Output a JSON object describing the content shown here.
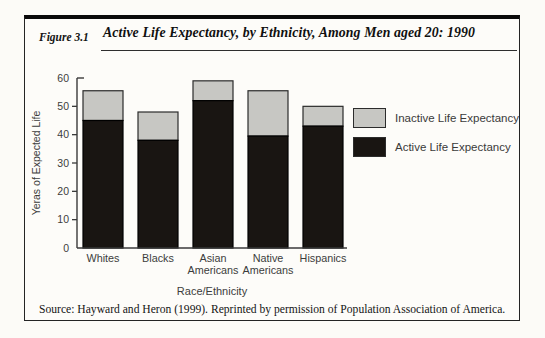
{
  "header": {
    "figure_label": "Figure 3.1",
    "title": "Active Life Expectancy, by Ethnicity, Among Men aged 20: 1990"
  },
  "source": "Source: Hayward and Heron (1999). Reprinted by permission of Population Association of America.",
  "legend": {
    "position": "right",
    "items": [
      {
        "label": "Inactive Life Expectancy",
        "color": "#c7c7c3"
      },
      {
        "label": "Active Life Expectancy",
        "color": "#191512"
      }
    ]
  },
  "chart_data": {
    "type": "bar",
    "stacked": true,
    "title": "Active Life Expectancy, by Ethnicity, Among Men aged 20: 1990",
    "categories": [
      "Whites",
      "Blacks",
      "Asian Americans",
      "Native Americans",
      "Hispanics"
    ],
    "series": [
      {
        "name": "Active Life Expectancy",
        "color": "#191512",
        "values": [
          45,
          38,
          52,
          39.5,
          43
        ]
      },
      {
        "name": "Inactive Life Expectancy",
        "color": "#c7c7c3",
        "values": [
          10.5,
          10,
          7,
          16,
          7
        ]
      }
    ],
    "totals": [
      55.5,
      48,
      59,
      55.5,
      50
    ],
    "xlabel": "Race/Ethnicity",
    "ylabel": "Yeras of Expected Life",
    "ylim": [
      0,
      60
    ],
    "yticks": [
      0,
      10,
      20,
      30,
      40,
      50,
      60
    ],
    "grid": false,
    "legend_position": "right",
    "axis_color": "#3a3a3a",
    "bar_stroke": "#2b2b2b"
  }
}
